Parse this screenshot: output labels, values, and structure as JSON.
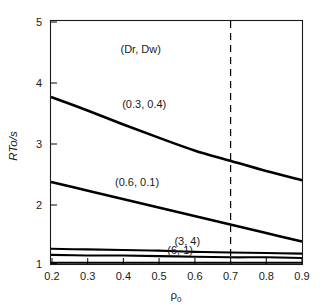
{
  "chart_data": {
    "type": "line",
    "title": "",
    "subtitle": "",
    "xlabel": "ρ₀",
    "xlabel_base": "ρ",
    "xlabel_sub": "0",
    "ylabel": "RTo/s",
    "xlim": [
      0.2,
      0.9
    ],
    "ylim": [
      1,
      5
    ],
    "xticks": [
      0.2,
      0.3,
      0.4,
      0.5,
      0.6,
      0.7,
      0.8,
      0.9
    ],
    "xticklabels": [
      "0.2",
      "0.3",
      "0.4",
      "0.5",
      "0.6",
      "0.7",
      "0.8",
      "0.9"
    ],
    "yticks": [
      1,
      2,
      3,
      4,
      5
    ],
    "yticklabels": [
      "1",
      "2",
      "3",
      "4",
      "5"
    ],
    "grid": false,
    "legend_position": "inline-annotations",
    "legend_header": "(Dr, Dw)",
    "annotations": [
      {
        "text": "(Dr, Dw)",
        "x": 0.45,
        "y": 4.47
      },
      {
        "text": "(0.3, 0.4)",
        "x": 0.46,
        "y": 3.56
      },
      {
        "text": "(0.6, 0.1)",
        "x": 0.44,
        "y": 2.28
      },
      {
        "text": "(3, 4)",
        "x": 0.58,
        "y": 1.32
      },
      {
        "text": "(6, 1)",
        "x": 0.56,
        "y": 1.17
      }
    ],
    "reference_lines": [
      {
        "orientation": "vertical",
        "x": 0.7,
        "style": "dashed",
        "label": ""
      }
    ],
    "x": [
      0.2,
      0.3,
      0.4,
      0.5,
      0.6,
      0.7,
      0.8,
      0.9
    ],
    "series": [
      {
        "name": "(0.3, 0.4)",
        "label": "(0.3, 0.4)",
        "values": [
          3.75,
          3.53,
          3.3,
          3.08,
          2.87,
          2.7,
          2.53,
          2.38
        ]
      },
      {
        "name": "(0.6, 0.1)",
        "label": "(0.6, 0.1)",
        "values": [
          2.35,
          2.21,
          2.07,
          1.93,
          1.79,
          1.65,
          1.51,
          1.37
        ]
      },
      {
        "name": "(3, 4)",
        "label": "(3, 4)",
        "values": [
          1.25,
          1.24,
          1.23,
          1.22,
          1.2,
          1.19,
          1.18,
          1.17
        ]
      },
      {
        "name": "(6, 1)",
        "label": "(6, 1)",
        "values": [
          1.15,
          1.14,
          1.14,
          1.13,
          1.12,
          1.11,
          1.11,
          1.1
        ]
      },
      {
        "name": "baseline",
        "label": "",
        "values": [
          1.02,
          1.02,
          1.02,
          1.02,
          1.02,
          1.02,
          1.02,
          1.02
        ]
      }
    ],
    "colors": {
      "curve": "#000000",
      "axis": "#1a1a1a",
      "background": "#ffffff"
    }
  }
}
